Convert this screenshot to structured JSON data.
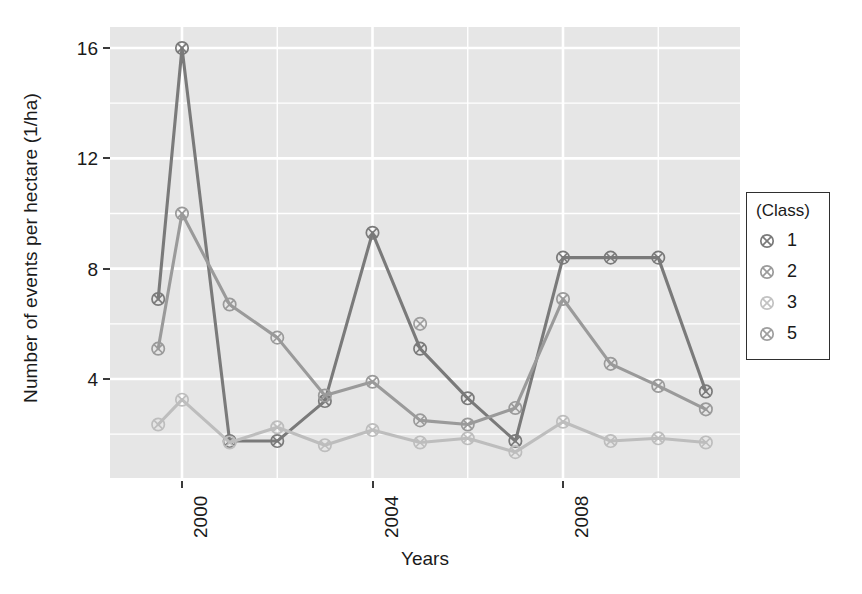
{
  "chart_data": {
    "type": "line",
    "title": "",
    "xlabel": "Years",
    "ylabel": "Number of events per hectare (1/ha)",
    "xlim": [
      1999.2,
      2010.8
    ],
    "ylim": [
      0.6,
      16.9
    ],
    "x_ticks": [
      2000,
      2004,
      2008
    ],
    "x_tick_labels": [
      "2000",
      "2004",
      "2008"
    ],
    "y_ticks": [
      4,
      8,
      12,
      16
    ],
    "y_tick_labels": [
      "4",
      "8",
      "12",
      "16"
    ],
    "grid": "major-and-minor-white-on-gray-panel",
    "legend_position": "right",
    "legend_title": "(Class)",
    "x": [
      1999.5,
      2000,
      2001,
      2002,
      2003,
      2004,
      2005,
      2006,
      2007,
      2008,
      2009,
      2010
    ],
    "series": [
      {
        "name": "1",
        "color": "#7a7a7a",
        "values": [
          6.9,
          16.0,
          1.75,
          1.75,
          3.2,
          9.3,
          5.1,
          3.3,
          1.75,
          8.4,
          8.4,
          8.4
        ],
        "x": [
          1999.5,
          2000,
          2001,
          2002,
          2003,
          2004,
          2005,
          2006,
          2007,
          2008,
          2009,
          2010
        ],
        "last_point_value": 3.55,
        "last_point_x": 2011
      },
      {
        "name": "2",
        "color": "#9a9a9a",
        "values": [
          5.1,
          10.0,
          6.7,
          5.5,
          3.4,
          3.9,
          2.5,
          2.35,
          2.95,
          6.9,
          4.55,
          3.75
        ],
        "x": [
          1999.5,
          2000,
          2001,
          2002,
          2003,
          2004,
          2005,
          2006,
          2007,
          2008,
          2009,
          2010
        ],
        "last_point_value": 2.9,
        "last_point_x": 2011
      },
      {
        "name": "3",
        "color": "#bdbdbd",
        "values": [
          2.35,
          3.25,
          1.7,
          2.25,
          1.6,
          2.15,
          1.7,
          1.85,
          1.35,
          2.45,
          1.75,
          1.85
        ],
        "x": [
          1999.5,
          2000,
          2001,
          2002,
          2003,
          2004,
          2005,
          2006,
          2007,
          2008,
          2009,
          2010
        ],
        "last_point_value": 1.7,
        "last_point_x": 2011
      },
      {
        "name": "5",
        "color": "#9e9e9e",
        "values": [
          6.0
        ],
        "x": [
          2005
        ],
        "note": "single isolated point, no connecting line"
      }
    ],
    "panel_color": "#e6e6e6",
    "gridline_color": "#ffffff"
  },
  "axes": {
    "y_title": "Number of events per hectare (1/ha)",
    "x_title": "Years"
  },
  "legend": {
    "title": "(Class)",
    "entries": [
      {
        "label": "1",
        "marker": "crossed-circle-marker",
        "color": "#7a7a7a"
      },
      {
        "label": "2",
        "marker": "crossed-circle-marker",
        "color": "#9a9a9a"
      },
      {
        "label": "3",
        "marker": "crossed-circle-marker",
        "color": "#c2c2c2"
      },
      {
        "label": "5",
        "marker": "crossed-circle-marker",
        "color": "#9e9e9e"
      }
    ]
  }
}
